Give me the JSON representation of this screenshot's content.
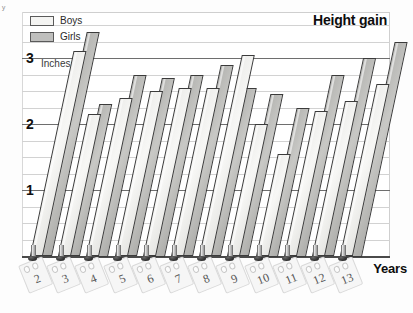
{
  "chart_data": {
    "type": "bar",
    "title": "Height gain",
    "xlabel": "Years",
    "ylabel": "Inches",
    "ylim": [
      0,
      3.5
    ],
    "yticks": [
      1,
      2,
      3
    ],
    "ytick_labels": [
      "1",
      "2",
      "3"
    ],
    "grid": true,
    "gridline_step": 0.25,
    "legend_position": "top-left",
    "categories": [
      "2",
      "3",
      "4",
      "5",
      "6",
      "7",
      "8",
      "9",
      "10",
      "11",
      "12",
      "13"
    ],
    "series": [
      {
        "name": "Boys",
        "color": "#f4f4f2",
        "values": [
          3.1,
          2.15,
          2.4,
          2.5,
          2.55,
          2.55,
          3.05,
          2.0,
          1.55,
          2.2,
          2.35,
          2.6
        ]
      },
      {
        "name": "Girls",
        "color": "#bfbfbd",
        "values": [
          3.4,
          2.3,
          2.75,
          2.7,
          2.75,
          2.9,
          2.55,
          2.45,
          2.25,
          2.75,
          3.0,
          3.25
        ]
      }
    ]
  },
  "legend": {
    "items": [
      {
        "label": "Boys",
        "swatch": "boys"
      },
      {
        "label": "Girls",
        "swatch": "girls"
      }
    ]
  },
  "axis": {
    "y_unit_label": "Inches",
    "y_labels": [
      "3",
      "2",
      "1"
    ],
    "x_title": "Years"
  },
  "corner": {
    "mark": "ʸ"
  }
}
